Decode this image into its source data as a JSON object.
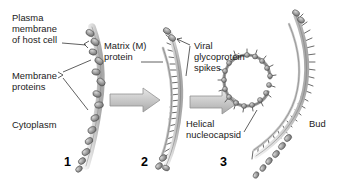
{
  "figure": {
    "background": "#ffffff",
    "width": 337,
    "height": 194
  },
  "labels": {
    "plasma_membrane": "Plasma\nmembrane\nof host cell",
    "membrane_proteins": "Membrane\nproteins",
    "cytoplasm": "Cytoplasm",
    "matrix_protein": "Matrix (M)\nprotein",
    "viral_spikes": "Viral\nglycoprotein\nspikes",
    "helical_nucleocapsid": "Helical\nnucleocapsid",
    "bud": "Bud"
  },
  "steps": [
    {
      "number": "1",
      "name": "membrane-with-proteins"
    },
    {
      "number": "2",
      "name": "matrix-and-spikes"
    },
    {
      "number": "3",
      "name": "budding-virion"
    }
  ],
  "colors": {
    "membrane_fill": "#d2d2d2",
    "membrane_stroke": "#6f6f6f",
    "protein_fill": "#8e8e8e",
    "protein_stroke": "#4a4a4a",
    "arrow_fill": "#cacaca",
    "arrow_stroke": "#8c8c8c",
    "spike_stroke": "#4f4f4f",
    "text": "#1b1b1b",
    "leader_line": "#2b2b2b"
  },
  "arrows": [
    {
      "name": "arrow-step1-to-step2"
    },
    {
      "name": "arrow-step2-to-step3"
    }
  ]
}
